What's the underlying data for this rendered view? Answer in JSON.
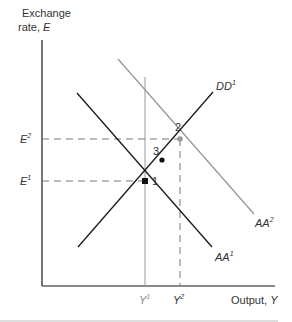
{
  "diagram": {
    "y_axis_label_line1": "Exchange",
    "y_axis_label_line2": "rate, ",
    "y_axis_symbol": "E",
    "x_axis_label": "Output, ",
    "x_axis_symbol": "Y",
    "ticks": {
      "e1_base": "E",
      "e1_sup": "1",
      "e2_base": "E",
      "e2_sup": "2",
      "y1_base": "Y",
      "y1_sup": "1",
      "y2_base": "Y",
      "y2_sup": "2"
    },
    "curves": {
      "dd1_base": "DD",
      "dd1_sup": "1",
      "aa1_base": "AA",
      "aa1_sup": "1",
      "aa2_base": "AA",
      "aa2_sup": "2"
    },
    "points": {
      "p1": "1",
      "p2": "2",
      "p3": "3"
    },
    "colors": {
      "axis": "#1a1a1a",
      "primary_curve": "#1a1a1a",
      "shifted_curve": "#999999",
      "guide": "#777777"
    }
  }
}
